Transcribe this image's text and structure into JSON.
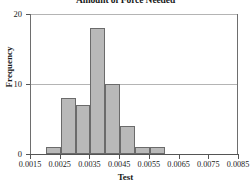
{
  "chart_data": {
    "type": "bar",
    "title": "Amount of Force Needed",
    "xlabel": "Test",
    "ylabel": "Frequency",
    "xlim": [
      0.0015,
      0.0085
    ],
    "ylim": [
      0,
      20
    ],
    "grid": true,
    "legend": false,
    "bin_width": 0.0005,
    "categories": [
      "0.0020-0.0025",
      "0.0025-0.0030",
      "0.0030-0.0035",
      "0.0035-0.0040",
      "0.0040-0.0045",
      "0.0045-0.0050",
      "0.0050-0.0055",
      "0.0055-0.0060"
    ],
    "bin_starts": [
      0.002,
      0.0025,
      0.003,
      0.0035,
      0.004,
      0.0045,
      0.005,
      0.0055
    ],
    "values": [
      1,
      8,
      7,
      18,
      10,
      4,
      1,
      1
    ],
    "total_count": 50,
    "xticks": [
      0.0015,
      0.0025,
      0.0035,
      0.0045,
      0.0055,
      0.0065,
      0.0075,
      0.0085
    ],
    "xtick_labels": [
      "0.0015",
      "0.0025",
      "0.0035",
      "0.0045",
      "0.0055",
      "0.0065",
      "0.0075",
      "0.0085"
    ],
    "yticks": [
      0,
      10,
      20
    ],
    "ytick_labels": [
      "0",
      "10",
      "20"
    ],
    "colors": {
      "bar_fill": "#b9b9b9",
      "bar_border": "#6b6b6b",
      "gridline": "#b4b4b4",
      "axis": "#555555",
      "text": "#1a1a1a",
      "background": "#ffffff"
    }
  }
}
